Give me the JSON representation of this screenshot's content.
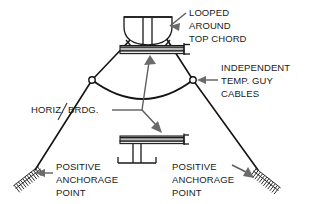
{
  "diagram": {
    "background_color": "#ffffff",
    "line_color": "#141414",
    "arrow_color": "#6b6b6b",
    "beam_fill_color": "#b9b9b9",
    "labels": {
      "looped_chord": {
        "line1": "LOOPED",
        "line2": "AROUND",
        "line3": "TOP CHORD"
      },
      "guy_cables": {
        "line1": "INDEPENDENT",
        "line2": "TEMP. GUY",
        "line3": "CABLES"
      },
      "horiz_brdg": {
        "part1": "HORIZ.",
        "part2": "BRDG."
      },
      "anchor_left": {
        "line1": "POSITIVE",
        "line2": "ANCHORAGE",
        "line3": "POINT"
      },
      "anchor_right": {
        "line1": "POSITIVE",
        "line2": "ANCHORAGE",
        "line3": "POINT"
      }
    }
  }
}
